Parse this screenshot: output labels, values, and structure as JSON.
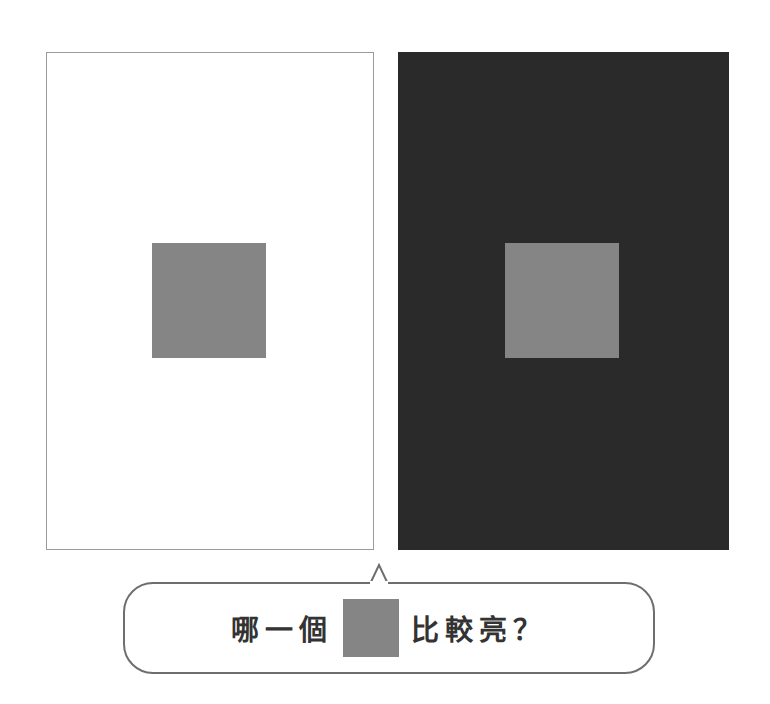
{
  "illusion": {
    "left_panel": {
      "background": "#ffffff",
      "square_color": "#858585"
    },
    "right_panel": {
      "background": "#2a2a2a",
      "square_color": "#858585"
    }
  },
  "question": {
    "prefix": "哪一個",
    "suffix": "比較亮？",
    "swatch_color": "#858585"
  }
}
